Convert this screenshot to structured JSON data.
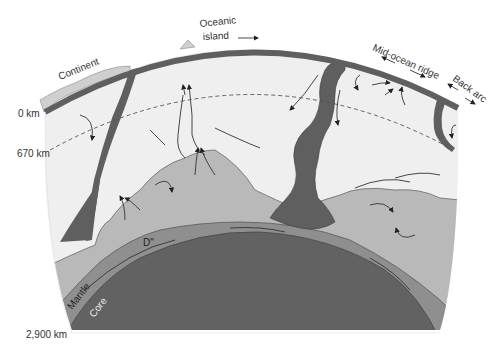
{
  "diagram": {
    "colors": {
      "background": "#ffffff",
      "upper_mantle": "#efefef",
      "lower_mantle_pile": "#b9b9b9",
      "slab": "#5f5f5f",
      "core": "#626262",
      "d_double_prime": "#8f8f8f",
      "continent": "#cfcfcf",
      "outline": "#555555"
    },
    "labels": {
      "oceanic_island": [
        "Oceanic",
        "island"
      ],
      "continent": "Continent",
      "mid_ocean_ridge": "Mid-ocean ridge",
      "back_arc": "Back arc",
      "depth_0": "0 km",
      "depth_670": "670 km",
      "depth_2900": "2,900 km",
      "d_layer": "D\"",
      "mantle": "Mantle",
      "core": "Core"
    },
    "depth_markers": [
      {
        "label": "0 km",
        "y": 113
      },
      {
        "label": "670 km",
        "y": 153
      },
      {
        "label": "2,900 km",
        "y": 333
      }
    ]
  }
}
